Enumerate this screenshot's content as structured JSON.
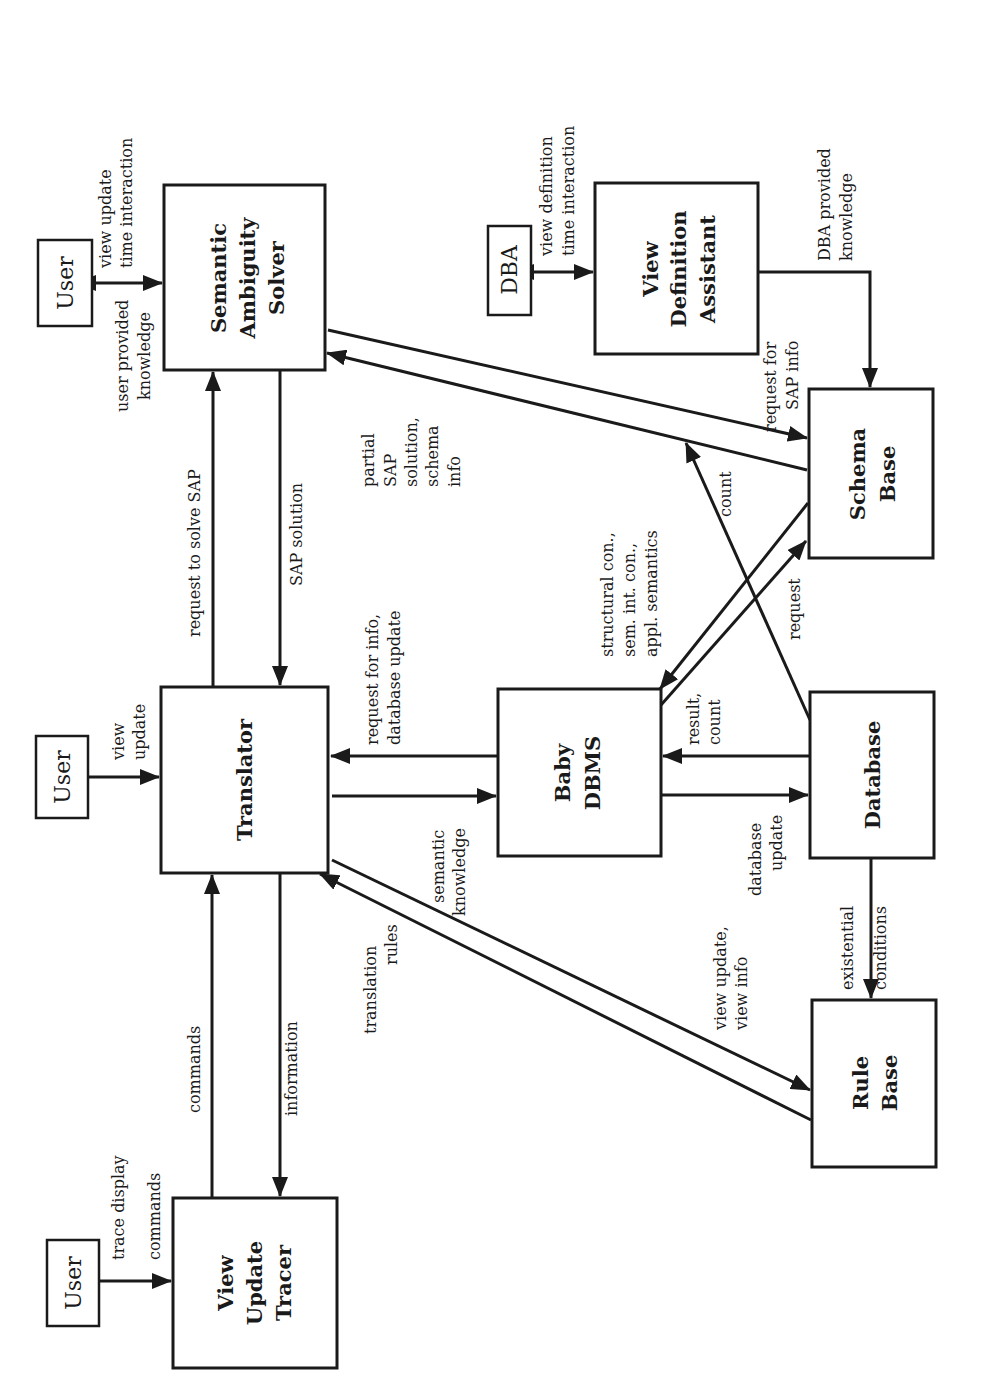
{
  "diagram": {
    "orientation": "rotated 90deg counter-clockwise",
    "components": {
      "semantic_ambiguity_solver": [
        "Semantic",
        "Ambiguity",
        "Solver"
      ],
      "view_definition_assistant": [
        "View",
        "Definition",
        "Assistant"
      ],
      "translator": [
        "Translator"
      ],
      "baby_dbms": [
        "Baby",
        "DBMS"
      ],
      "schema_base": [
        "Schema",
        "Base"
      ],
      "database": [
        "Database"
      ],
      "rule_base": [
        "Rule",
        "Base"
      ],
      "view_update_tracer": [
        "View",
        "Update",
        "Tracer"
      ]
    },
    "actors": {
      "user_top": "User",
      "user_middle": "User",
      "user_bottom": "User",
      "dba": "DBA"
    },
    "edge_labels": {
      "user_sas_1": "view update",
      "user_sas_2": "time  interaction",
      "user_sas_3": "user provided",
      "user_sas_4": "knowledge",
      "dba_vda_1": "view definition",
      "dba_vda_2": "time  interaction",
      "dba_knowledge_1": "DBA provided",
      "dba_knowledge_2": "knowledge",
      "request_solve_sap": "request to solve SAP",
      "sap_solution": "SAP solution",
      "partial_1": "partial",
      "partial_2": "SAP",
      "partial_3": "solution,",
      "partial_4": "schema",
      "partial_5": "info",
      "req_sap_info_1": "request for",
      "req_sap_info_2": "SAP info",
      "count": "count",
      "structural_1": "structural con.,",
      "structural_2": "sem. int. con.,",
      "structural_3": "appl.  semantics",
      "request": "request",
      "view_update_1": "view",
      "view_update_2": "update",
      "req_info_1": "request for info,",
      "req_info_2": "database update",
      "semantic_knowledge_1": "semantic",
      "semantic_knowledge_2": "knowledge",
      "result_count_1": "result,",
      "result_count_2": "count",
      "database_update_1": "database",
      "database_update_2": "update",
      "existential_1": "existential",
      "existential_2": "conditions",
      "view_info_1": "view update,",
      "view_info_2": "view info",
      "translation_rules_1": "translation",
      "translation_rules_2": "rules",
      "commands": "commands",
      "information": "information",
      "trace_1": "trace  display",
      "trace_2": "commands"
    }
  }
}
